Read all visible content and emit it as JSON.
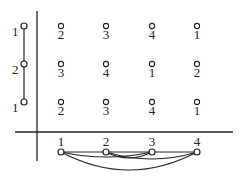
{
  "left_column": {
    "nodes": [
      {
        "label": "1",
        "y": 26
      },
      {
        "label": "2",
        "y": 64
      },
      {
        "label": "1",
        "y": 102
      }
    ]
  },
  "grid": {
    "columns_x": [
      61,
      106,
      152,
      197
    ],
    "rows": [
      {
        "y": 26,
        "values": [
          "2",
          "3",
          "4",
          "1"
        ]
      },
      {
        "y": 64,
        "values": [
          "3",
          "4",
          "1",
          "2"
        ]
      },
      {
        "y": 102,
        "values": [
          "2",
          "3",
          "4",
          "1"
        ]
      }
    ]
  },
  "bottom_graph": {
    "nodes": [
      {
        "label": "1",
        "x": 61
      },
      {
        "label": "2",
        "x": 106
      },
      {
        "label": "3",
        "x": 152
      },
      {
        "label": "4",
        "x": 197
      }
    ],
    "edges": [
      [
        "1",
        "2"
      ],
      [
        "2",
        "3"
      ],
      [
        "3",
        "4"
      ],
      [
        "1",
        "3"
      ],
      [
        "2",
        "4"
      ],
      [
        "1",
        "4"
      ]
    ]
  },
  "colors": {
    "stroke": "#222222",
    "background": "#ffffff"
  }
}
